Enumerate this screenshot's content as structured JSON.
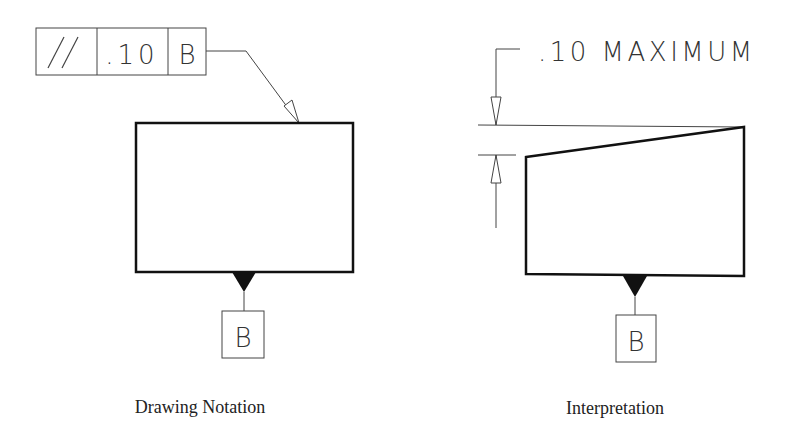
{
  "left_panel": {
    "feature_control_frame": {
      "symbol": "//",
      "symbol_name": "parallelism",
      "tolerance": ".10",
      "datum": "B"
    },
    "datum_label": "B",
    "caption": "Drawing Notation"
  },
  "right_panel": {
    "dimension_note": ".10 MAXIMUM",
    "datum_label": "B",
    "caption": "Interpretation"
  }
}
